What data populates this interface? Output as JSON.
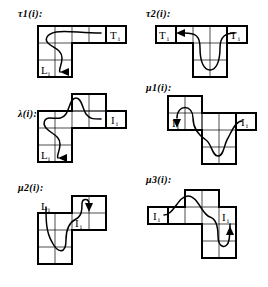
{
  "figure": {
    "background_color": "#ffffff",
    "ink_color": "#000000",
    "panel_count": 6,
    "notation": {
      "subscript": "i",
      "colon": ":"
    }
  },
  "panels": [
    {
      "id": "tau1",
      "label": "τ1(i):",
      "label_x": 18,
      "label_y": 10,
      "shape": "L-shape: top row of 4 cells, left 2 columns extend down 2 rows",
      "cell_size": 17,
      "origin_x": 38,
      "origin_y": 26,
      "cells": [
        {
          "col": 0,
          "row": 0
        },
        {
          "col": 1,
          "row": 0
        },
        {
          "col": 2,
          "row": 0
        },
        {
          "col": 3,
          "row": 0
        },
        {
          "col": 0,
          "row": 1
        },
        {
          "col": 1,
          "row": 1
        },
        {
          "col": 0,
          "row": 2
        },
        {
          "col": 1,
          "row": 2
        }
      ],
      "side_boxes": [
        {
          "name": "T-box-right",
          "label": "T",
          "sub": "i",
          "col": 4,
          "row": 0
        }
      ],
      "inner_labels": [
        {
          "name": "L-label",
          "label": "L",
          "sub": "i",
          "col": 0,
          "row": 2
        }
      ],
      "curve": "M 8,10 C 30,-2 60,6 72,2 M 8,10 C 22,22 28,26 24,38 C 20,46 14,44 16,50",
      "arrow": {
        "name": "arrow-left-into-L",
        "x": 36,
        "y": 48,
        "direction": "left"
      }
    },
    {
      "id": "tau2",
      "label": "τ2(i):",
      "label_x": 146,
      "label_y": 10,
      "shape": "T-shape: top row of 3 cells, middle 2 columns extend down 2 rows",
      "cell_size": 17,
      "origin_x": 176,
      "origin_y": 26,
      "cells": [
        {
          "col": 0,
          "row": 0
        },
        {
          "col": 1,
          "row": 0
        },
        {
          "col": 2,
          "row": 0
        },
        {
          "col": 1,
          "row": 1
        },
        {
          "col": 2,
          "row": 1
        },
        {
          "col": 1,
          "row": 2
        },
        {
          "col": 2,
          "row": 2
        }
      ],
      "side_boxes": [
        {
          "name": "T-box-left",
          "label": "T",
          "sub": "i",
          "col": -1,
          "row": 0
        },
        {
          "name": "T-box-right",
          "label": "T",
          "sub": "i",
          "col": 3,
          "row": 0
        }
      ],
      "inner_labels": [],
      "curve": "M 14,6 C 30,6 30,16 30,30 C 30,44 44,44 44,30 C 44,16 52,6 64,6",
      "arrow": {
        "name": "arrow-left-into-T",
        "x": 4,
        "y": 6,
        "direction": "left"
      }
    },
    {
      "id": "lambda",
      "label": "λ(i):",
      "label_x": 18,
      "label_y": 108,
      "shape": "S/Z-shape: upper-right block of 2x2, mid row spans left, lower-left block of 2x2",
      "cell_size": 17,
      "origin_x": 38,
      "origin_y": 94,
      "cells": [
        {
          "col": 2,
          "row": 0
        },
        {
          "col": 3,
          "row": 0
        },
        {
          "col": 0,
          "row": 1
        },
        {
          "col": 1,
          "row": 1
        },
        {
          "col": 2,
          "row": 1
        },
        {
          "col": 3,
          "row": 1
        },
        {
          "col": 0,
          "row": 2
        },
        {
          "col": 1,
          "row": 2
        },
        {
          "col": 0,
          "row": 3
        },
        {
          "col": 1,
          "row": 3
        }
      ],
      "side_boxes": [
        {
          "name": "I-box-right",
          "label": "I",
          "sub": "i",
          "col": 4,
          "row": 1
        }
      ],
      "inner_labels": [
        {
          "name": "L-label",
          "label": "L",
          "sub": "i",
          "col": 0,
          "row": 3
        }
      ],
      "curve": "M 6,36 C 20,26 24,8 36,8 C 48,8 50,30 62,30 M 6,36 C 20,46 24,50 20,60 C 16,66 12,64 14,70",
      "arrow": {
        "name": "arrow-left-into-L",
        "x": 34,
        "y": 68,
        "direction": "left"
      }
    },
    {
      "id": "mu1",
      "label": "μ1(i):",
      "label_x": 146,
      "label_y": 90,
      "shape": "Z-shape: upper-left block of 2x2, mid row, lower-right block of 2x2",
      "cell_size": 17,
      "origin_x": 168,
      "origin_y": 94,
      "cells": [
        {
          "col": 0,
          "row": 0
        },
        {
          "col": 1,
          "row": 0
        },
        {
          "col": 0,
          "row": 1
        },
        {
          "col": 1,
          "row": 1
        },
        {
          "col": 2,
          "row": 1
        },
        {
          "col": 3,
          "row": 1
        },
        {
          "col": 2,
          "row": 2
        },
        {
          "col": 3,
          "row": 2
        },
        {
          "col": 2,
          "row": 3
        },
        {
          "col": 3,
          "row": 3
        }
      ],
      "side_boxes": [
        {
          "name": "I-box-right",
          "label": "I",
          "sub": "i",
          "col": 4,
          "row": 1
        }
      ],
      "inner_labels": [
        {
          "name": "I-label-left",
          "label": "I",
          "sub": "i",
          "col": 0,
          "row": 1
        }
      ],
      "curve": "M 10,22 C 10,6 26,6 26,22 C 26,38 40,36 40,50 C 40,64 52,64 52,50 C 52,38 60,30 68,30",
      "arrow": {
        "name": "arrow-down-into-I",
        "x": 10,
        "y": 32,
        "direction": "down"
      }
    },
    {
      "id": "mu2",
      "label": "μ2(i):",
      "label_x": 18,
      "label_y": 186,
      "shape": "Z-shape: upper-right block of 2x2, mid row, lower-left block of 2x2",
      "cell_size": 17,
      "origin_x": 38,
      "origin_y": 196,
      "cells": [
        {
          "col": 2,
          "row": 0
        },
        {
          "col": 3,
          "row": 0
        },
        {
          "col": 0,
          "row": 1
        },
        {
          "col": 1,
          "row": 1
        },
        {
          "col": 2,
          "row": 1
        },
        {
          "col": 3,
          "row": 1
        },
        {
          "col": 0,
          "row": 2
        },
        {
          "col": 1,
          "row": 2
        },
        {
          "col": 0,
          "row": 3
        },
        {
          "col": 1,
          "row": 3
        }
      ],
      "side_boxes": [],
      "inner_labels": [
        {
          "name": "L-label-left",
          "label": "L",
          "sub": "i",
          "col": 0,
          "row": 1
        },
        {
          "name": "I-label-right",
          "label": "I",
          "sub": "i",
          "col": 2,
          "row": 1
        }
      ],
      "curve": "M 10,56 C 10,44 24,44 26,32 C 28,20 40,22 44,16 C 50,8 56,8 56,16",
      "arrow": {
        "name": "arrow-down-into-I",
        "x": 56,
        "y": 22,
        "direction": "down"
      },
      "curve2": "M 10,56 C 10,70 26,70 26,56"
    },
    {
      "id": "mu3",
      "label": "μ3(i):",
      "label_x": 146,
      "label_y": 180,
      "shape": "T/Z-shape: upper-middle block, wide mid row, lower-right block",
      "cell_size": 17,
      "origin_x": 168,
      "origin_y": 190,
      "cells": [
        {
          "col": 1,
          "row": 0
        },
        {
          "col": 2,
          "row": 0
        },
        {
          "col": 0,
          "row": 1
        },
        {
          "col": 1,
          "row": 1
        },
        {
          "col": 2,
          "row": 1
        },
        {
          "col": 3,
          "row": 1
        },
        {
          "col": 2,
          "row": 2
        },
        {
          "col": 3,
          "row": 2
        },
        {
          "col": 2,
          "row": 3
        },
        {
          "col": 3,
          "row": 3
        }
      ],
      "side_boxes": [
        {
          "name": "I-box-left",
          "label": "I",
          "sub": "i",
          "col": -1,
          "row": 1
        }
      ],
      "inner_labels": [
        {
          "name": "I-label-right",
          "label": "I",
          "sub": "i",
          "col": 3,
          "row": 1
        }
      ],
      "curve": "M 4,30 C 14,30 18,8 28,8 C 38,8 42,30 52,30 C 60,30 62,44 62,54",
      "arrow": {
        "name": "arrow-up-into-I",
        "x": 62,
        "y": 40,
        "direction": "up"
      }
    }
  ]
}
